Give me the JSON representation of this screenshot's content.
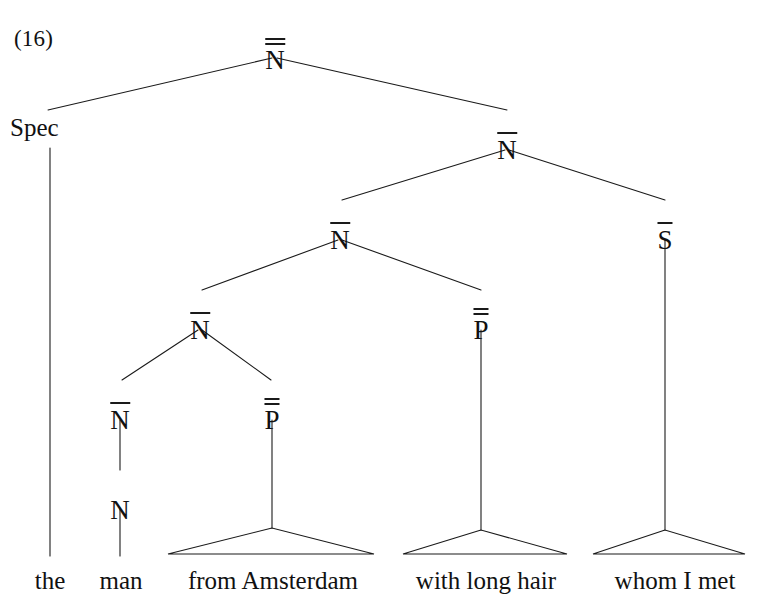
{
  "figure": {
    "example_number": "(16)",
    "ink_color": "#1a1a1a",
    "background_color": "#ffffff",
    "width": 763,
    "height": 608
  },
  "nodes": {
    "root": {
      "label": "N",
      "bars": 2,
      "x": 275,
      "y": 38
    },
    "spec": {
      "label": "Spec",
      "bars": 0,
      "x": 10,
      "y": 115
    },
    "nbar_top": {
      "label": "N",
      "bars": 1,
      "x": 507,
      "y": 128
    },
    "nbar_mid": {
      "label": "N",
      "bars": 1,
      "x": 340,
      "y": 218
    },
    "sbar": {
      "label": "S",
      "bars": 1,
      "x": 665,
      "y": 218
    },
    "nbar_low": {
      "label": "N",
      "bars": 1,
      "x": 200,
      "y": 308
    },
    "pp_mid": {
      "label": "P",
      "bars": 2,
      "x": 481,
      "y": 308
    },
    "nbar_bottom": {
      "label": "N",
      "bars": 1,
      "x": 120,
      "y": 398
    },
    "pp_low": {
      "label": "P",
      "bars": 2,
      "x": 272,
      "y": 398
    },
    "n_head": {
      "label": "N",
      "bars": 0,
      "x": 120,
      "y": 488
    }
  },
  "terminals": [
    {
      "id": "the",
      "text": "the",
      "x": 50,
      "y": 568
    },
    {
      "id": "man",
      "text": "man",
      "x": 121,
      "y": 568
    },
    {
      "id": "from-amsterdam",
      "text": "from Amsterdam",
      "x": 273,
      "y": 568
    },
    {
      "id": "with-long-hair",
      "text": "with long hair",
      "x": 486,
      "y": 568
    },
    {
      "id": "whom-i-met",
      "text": "whom I met",
      "x": 675,
      "y": 568
    }
  ],
  "triangles": [
    {
      "id": "from-amsterdam-triangle",
      "apex_x": 272,
      "apex_y": 528,
      "left_x": 168,
      "right_x": 374,
      "base_y": 554
    },
    {
      "id": "with-long-hair-triangle",
      "apex_x": 481,
      "apex_y": 530,
      "left_x": 403,
      "right_x": 567,
      "base_y": 554
    },
    {
      "id": "whom-i-met-triangle",
      "apex_x": 665,
      "apex_y": 530,
      "left_x": 593,
      "right_x": 745,
      "base_y": 554
    }
  ],
  "edges": [
    {
      "id": "root-to-spec",
      "x1": 272,
      "y1": 58,
      "x2": 48,
      "y2": 110
    },
    {
      "id": "root-to-nbar-top",
      "x1": 277,
      "y1": 58,
      "x2": 507,
      "y2": 110
    },
    {
      "id": "spec-to-the",
      "x1": 50,
      "y1": 148,
      "x2": 50,
      "y2": 556
    },
    {
      "id": "nbar-top-to-nbar-mid",
      "x1": 505,
      "y1": 150,
      "x2": 342,
      "y2": 200
    },
    {
      "id": "nbar-top-to-sbar",
      "x1": 509,
      "y1": 150,
      "x2": 665,
      "y2": 200
    },
    {
      "id": "nbar-mid-to-nbar-low",
      "x1": 338,
      "y1": 240,
      "x2": 202,
      "y2": 290
    },
    {
      "id": "nbar-mid-to-pp-mid",
      "x1": 342,
      "y1": 240,
      "x2": 481,
      "y2": 290
    },
    {
      "id": "sbar-to-whom-i-met",
      "x1": 665,
      "y1": 240,
      "x2": 665,
      "y2": 530
    },
    {
      "id": "nbar-low-to-nbar-bottom",
      "x1": 198,
      "y1": 330,
      "x2": 122,
      "y2": 380
    },
    {
      "id": "nbar-low-to-pp-low",
      "x1": 202,
      "y1": 330,
      "x2": 271,
      "y2": 380
    },
    {
      "id": "pp-mid-to-with-long-hair",
      "x1": 481,
      "y1": 330,
      "x2": 481,
      "y2": 530
    },
    {
      "id": "nbar-bottom-to-n-head",
      "x1": 120,
      "y1": 420,
      "x2": 120,
      "y2": 470
    },
    {
      "id": "pp-low-to-from-amsterdam",
      "x1": 272,
      "y1": 420,
      "x2": 272,
      "y2": 528
    },
    {
      "id": "n-head-to-man",
      "x1": 120,
      "y1": 508,
      "x2": 120,
      "y2": 556
    }
  ]
}
